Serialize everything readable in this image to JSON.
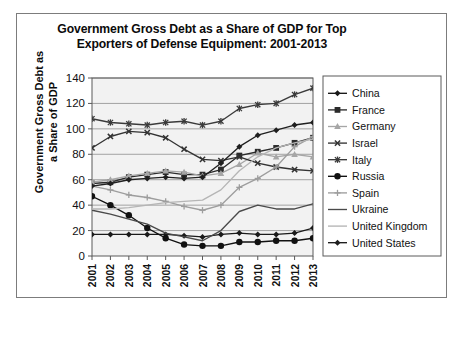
{
  "chart_data": {
    "type": "line",
    "title": "Government Gross Debt as a Share of GDP for Top Exporters of Defense Equipment: 2001-2013",
    "title_line1": "Government Gross Debt as a Share of GDP for Top",
    "title_line2": "Exporters of Defense Equipment: 2001-2013",
    "xlabel": "Year",
    "ylabel": "Government Gross Debt as a Share of GDP",
    "ylabel_line1": "Government Gross Debt as",
    "ylabel_line2": "a Share of GDP",
    "categories": [
      "2001",
      "2002",
      "2003",
      "2004",
      "2005",
      "2006",
      "2007",
      "2008",
      "2009",
      "2010",
      "2011",
      "2012",
      "2013"
    ],
    "x": [
      2001,
      2002,
      2003,
      2004,
      2005,
      2006,
      2007,
      2008,
      2009,
      2010,
      2011,
      2012,
      2013
    ],
    "ylim": [
      0,
      140
    ],
    "yticks": [
      "0",
      "20",
      "40",
      "60",
      "80",
      "100",
      "120",
      "140"
    ],
    "ytick_values": [
      0,
      20,
      40,
      60,
      80,
      100,
      120,
      140
    ],
    "grid": true,
    "legend_position": "right",
    "series": [
      {
        "name": "China",
        "marker": "diamond",
        "color": "#1a1a1a",
        "values": [
          17,
          17,
          17,
          17,
          17,
          16,
          15,
          17,
          18,
          17,
          17,
          18,
          22
        ]
      },
      {
        "name": "France",
        "marker": "square",
        "color": "#2b2b2b",
        "values": [
          57,
          58,
          62,
          64,
          66,
          64,
          64,
          68,
          79,
          82,
          85,
          89,
          93
        ]
      },
      {
        "name": "Germany",
        "marker": "triangle",
        "color": "#a6a6a6",
        "values": [
          58,
          60,
          63,
          65,
          67,
          66,
          63,
          65,
          72,
          81,
          78,
          80,
          78
        ]
      },
      {
        "name": "Israel",
        "marker": "x",
        "color": "#333333",
        "values": [
          85,
          94,
          98,
          97,
          93,
          84,
          76,
          75,
          78,
          73,
          70,
          68,
          67
        ]
      },
      {
        "name": "Italy",
        "marker": "asterisk",
        "color": "#3a3a3a",
        "values": [
          108,
          105,
          104,
          103,
          105,
          106,
          103,
          106,
          116,
          119,
          120,
          127,
          132
        ]
      },
      {
        "name": "Russia",
        "marker": "circle",
        "color": "#111111",
        "values": [
          47,
          40,
          32,
          22,
          14,
          9,
          8,
          8,
          11,
          11,
          12,
          12,
          14
        ]
      },
      {
        "name": "Spain",
        "marker": "plus",
        "color": "#9d9d9d",
        "values": [
          55,
          52,
          48,
          46,
          43,
          39,
          36,
          40,
          54,
          61,
          70,
          86,
          94
        ]
      },
      {
        "name": "Ukraine",
        "marker": "none",
        "color": "#4a4a4a",
        "values": [
          36,
          33,
          29,
          25,
          18,
          15,
          12,
          20,
          35,
          40,
          37,
          37,
          41
        ]
      },
      {
        "name": "United Kingdom",
        "marker": "none",
        "color": "#b5b5b5",
        "values": [
          37,
          37,
          38,
          40,
          42,
          43,
          44,
          52,
          67,
          78,
          85,
          89,
          92
        ]
      },
      {
        "name": "United States",
        "marker": "diamond",
        "color": "#1f1f1f",
        "values": [
          55,
          57,
          60,
          61,
          62,
          61,
          62,
          73,
          86,
          95,
          99,
          103,
          105
        ]
      }
    ]
  }
}
